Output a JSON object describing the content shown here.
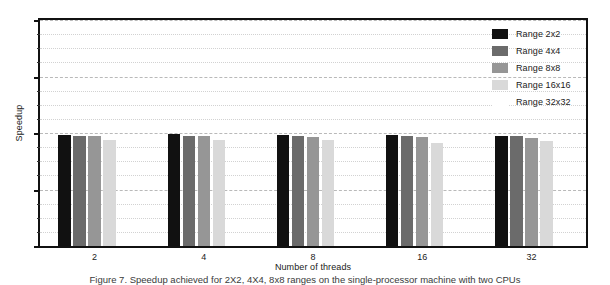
{
  "chart_data": {
    "type": "bar",
    "title": "",
    "xlabel": "Number of threads",
    "ylabel": "Speedup",
    "categories": [
      "2",
      "4",
      "8",
      "16",
      "32"
    ],
    "ylim": [
      0,
      4
    ],
    "yticks": [
      0,
      1,
      2,
      3,
      4
    ],
    "ytick_labels": [
      "0",
      "1",
      "2",
      "3",
      "4"
    ],
    "grid": true,
    "legend_position": "top-right",
    "series": [
      {
        "name": "Range 2x2",
        "color": "#111111",
        "values": [
          1.97,
          1.98,
          1.97,
          1.96,
          1.95
        ]
      },
      {
        "name": "Range 4x4",
        "color": "#6b6b6b",
        "values": [
          1.94,
          1.95,
          1.94,
          1.95,
          1.94
        ]
      },
      {
        "name": "Range 8x8",
        "color": "#969696",
        "values": [
          1.95,
          1.94,
          1.93,
          1.93,
          1.92
        ]
      },
      {
        "name": "Range 16x16",
        "color": "#d9d9d9",
        "values": [
          1.88,
          1.88,
          1.87,
          1.82,
          1.86
        ]
      },
      {
        "name": "Range 32x32",
        "color": "#ffffff",
        "values": [
          0,
          0,
          0,
          0,
          0
        ]
      }
    ]
  },
  "caption": "Figure 7. Speedup achieved for 2X2, 4X4, 8x8 ranges on the single-processor machine with two CPUs"
}
